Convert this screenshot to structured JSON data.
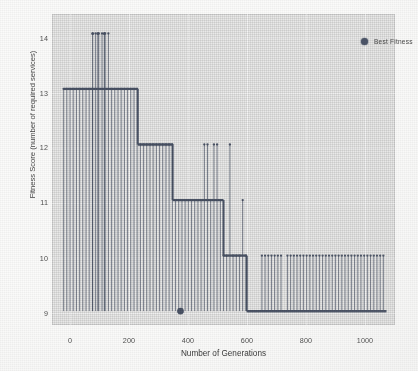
{
  "figure": {
    "background_color": "#fbfbfa",
    "plot_background_color": "#ececeb",
    "series_color": "#454f63"
  },
  "legend": {
    "label": "Best Fitness",
    "marker": "circle-marker",
    "position": "top-right"
  },
  "chart_data": {
    "type": "line",
    "title": "",
    "subtitle": "",
    "xlabel": "Number of Generations",
    "ylabel": "Fitness Score (number of required services)",
    "xlim": [
      -40,
      1140
    ],
    "ylim": [
      8.75,
      14.35
    ],
    "xticks": [
      0,
      200,
      400,
      600,
      800,
      1000
    ],
    "xticklabels": [
      "0",
      "200",
      "400",
      "600",
      "800",
      "1000"
    ],
    "yticks": [
      9,
      10,
      11,
      12,
      13,
      14
    ],
    "yticklabels": [
      "9",
      "10",
      "11",
      "12",
      "13",
      "14"
    ],
    "grid": true,
    "legend_position": "upper right",
    "marker": "circle-marker",
    "series": [
      {
        "name": "Best Fitness",
        "color": "#454f63",
        "style": "stem-step",
        "x": [
          0,
          20,
          40,
          60,
          80,
          100,
          120,
          140,
          160,
          170,
          180,
          190,
          200,
          210,
          220,
          230,
          240,
          250,
          258,
          266,
          274,
          282,
          290,
          298,
          306,
          314,
          322,
          330,
          338,
          346,
          354,
          362,
          370,
          378,
          386,
          394,
          402,
          410,
          418,
          426,
          434,
          442,
          450,
          458,
          466,
          474,
          482,
          490,
          498,
          506,
          514,
          522,
          530,
          540,
          550,
          560,
          570,
          580,
          590,
          600,
          612,
          624,
          636,
          648,
          660,
          672,
          684,
          696,
          708,
          720,
          732,
          744,
          756,
          768,
          780,
          792,
          804,
          816,
          828,
          840,
          852,
          864,
          876,
          888,
          900,
          912,
          924,
          936,
          948,
          960,
          972,
          984,
          996,
          1008,
          1020,
          1032,
          1044,
          1056,
          1068,
          1080,
          1092,
          1104
        ],
        "y": [
          13,
          13,
          13,
          13,
          13,
          14,
          14,
          14,
          13,
          13,
          13,
          13,
          13,
          13,
          13,
          13,
          13,
          13,
          12,
          12,
          12,
          12,
          12,
          12,
          12,
          12,
          12,
          12,
          12,
          12,
          12,
          12,
          12,
          11,
          11,
          11,
          11,
          11,
          11,
          11,
          11,
          11,
          11,
          11,
          11,
          11,
          12,
          12,
          11,
          11,
          12,
          12,
          11,
          10,
          10,
          10,
          12,
          10,
          10,
          10,
          11,
          10,
          9,
          9,
          9,
          10,
          10,
          10,
          10,
          10,
          10,
          10,
          9,
          10,
          10,
          10,
          10,
          10,
          10,
          10,
          10,
          10,
          10,
          10,
          10,
          10,
          10,
          10,
          10,
          10,
          10,
          10,
          10,
          10,
          10,
          10,
          10,
          10,
          10,
          10,
          10,
          10
        ],
        "annotations": [
          {
            "label": "best-solution-marker",
            "x": 402,
            "y": 9,
            "note": "enlarged marker at first descent to 9"
          }
        ]
      }
    ],
    "plateaus": [
      {
        "value": 13,
        "x_start": 0,
        "x_end": 255
      },
      {
        "value": 12,
        "x_start": 255,
        "x_end": 375
      },
      {
        "value": 11,
        "x_start": 375,
        "x_end": 550
      },
      {
        "value": 10,
        "x_start": 550,
        "x_end": 630
      },
      {
        "value": 9,
        "x_start": 630,
        "x_end": 1110
      }
    ],
    "peaks": [
      {
        "x": 100,
        "y": 14
      },
      {
        "x": 118,
        "y": 14
      },
      {
        "x": 140,
        "y": 14
      }
    ]
  }
}
